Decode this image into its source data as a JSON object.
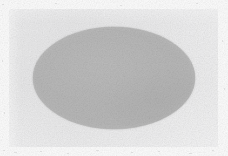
{
  "image": {
    "kind": "scanned-figure",
    "width": 228,
    "height": 156,
    "background_color": "#ffffff",
    "description": "A solid light-gray ellipse centered on a light gray rectangular panel with a white margin"
  },
  "panel": {
    "name": "figure-panel",
    "fill_color": "#ededee",
    "x": 9,
    "y": 9,
    "width": 209,
    "height": 138
  },
  "shapes": [
    {
      "type": "ellipse",
      "name": "gray-ellipse",
      "fill_color": "#b9b9b9",
      "stroke_color": "none",
      "center_x": 114,
      "center_y": 78,
      "width": 162,
      "height": 102,
      "semi_major_axis": 81,
      "semi_minor_axis": 51
    }
  ],
  "text": {
    "labels": [],
    "title": "",
    "caption": ""
  },
  "colors": {
    "canvas": "#ffffff",
    "panel": "#ededee",
    "ellipse": "#b9b9b9"
  }
}
